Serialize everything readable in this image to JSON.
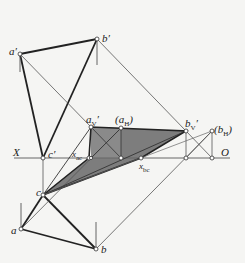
{
  "diagram": {
    "type": "descriptive-geometry-projection",
    "colors": {
      "background": "#f5f5f3",
      "thick_line": "#222222",
      "thin_line": "#555555",
      "shadow_fill": "#7a7a7a",
      "shadow_fill_light": "#9a9a9a"
    },
    "axis": {
      "left_label": "X",
      "right_label": "O",
      "y": 158
    },
    "points": {
      "a_prime": {
        "label": "a'",
        "x": 20,
        "y": 54
      },
      "b_prime": {
        "label": "b'",
        "x": 97,
        "y": 39
      },
      "c_prime": {
        "label": "c'",
        "x": 43,
        "y": 158
      },
      "a_v_prime": {
        "label": "aV'",
        "x": 91,
        "y": 127
      },
      "a_h": {
        "label": "(aH)",
        "x": 121,
        "y": 128
      },
      "b_v_prime": {
        "label": "bV'",
        "x": 186,
        "y": 131
      },
      "b_h": {
        "label": "(bH)",
        "x": 212,
        "y": 131
      },
      "x_ac": {
        "label": "xac",
        "x": 89,
        "y": 158
      },
      "x_bc": {
        "label": "xbc",
        "x": 141,
        "y": 158
      },
      "c": {
        "label": "c",
        "x": 43,
        "y": 195
      },
      "a": {
        "label": "a",
        "x": 21,
        "y": 229
      },
      "b": {
        "label": "b",
        "x": 96,
        "y": 249
      }
    },
    "labels": {
      "a_prime": "a",
      "a_prime_mark": "′",
      "b_prime": "b",
      "b_prime_mark": "′",
      "c_prime": "c",
      "c_prime_mark": "′",
      "a_v": "a",
      "a_v_sub": "V",
      "a_v_mark": "′",
      "a_h_open": "(a",
      "a_h_sub": "H",
      "a_h_close": ")",
      "b_v": "b",
      "b_v_sub": "V",
      "b_v_mark": "′",
      "b_h_open": "(b",
      "b_h_sub": "H",
      "b_h_close": ")",
      "x_ac": "x",
      "x_ac_sub": "ac",
      "x_bc": "x",
      "x_bc_sub": "bc",
      "c": "c",
      "a": "a",
      "b": "b",
      "axis_x": "X",
      "axis_o": "O"
    }
  }
}
